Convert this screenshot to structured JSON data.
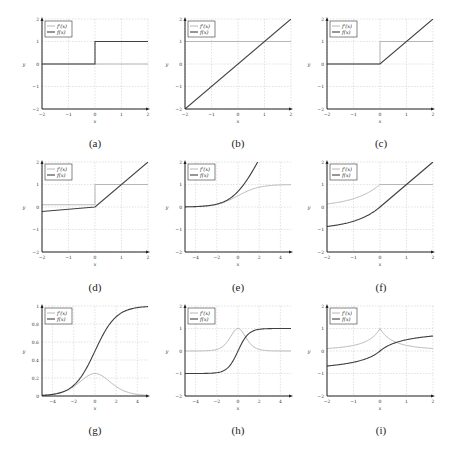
{
  "figure": {
    "colors": {
      "derivative": "#b0b0b0",
      "function": "#404040",
      "grid": "#cfcfcf",
      "axis": "#222222"
    },
    "legend": {
      "derivative_label": "f'(x)",
      "function_label": "f(x)"
    }
  },
  "chart_data": [
    {
      "id": "a",
      "caption": "(a)",
      "type": "line",
      "title": "Binary step",
      "xlabel": "x",
      "ylabel": "y",
      "xlim": [
        -2,
        2
      ],
      "ylim": [
        -2,
        2
      ],
      "xticks": [
        -2,
        -1,
        0,
        1,
        2
      ],
      "yticks": [
        -2,
        -1,
        0,
        1,
        2
      ],
      "grid": true,
      "legend_position": "upper left",
      "series": [
        {
          "name": "f'(x)",
          "x": [
            -2,
            2
          ],
          "y": [
            0,
            0
          ]
        },
        {
          "name": "f(x)",
          "x": [
            -2,
            0,
            0,
            2
          ],
          "y": [
            0,
            0,
            1,
            1
          ]
        }
      ]
    },
    {
      "id": "b",
      "caption": "(b)",
      "type": "line",
      "title": "Identity",
      "xlabel": "x",
      "ylabel": "y",
      "xlim": [
        -2,
        2
      ],
      "ylim": [
        -2,
        2
      ],
      "xticks": [
        -2,
        -1,
        0,
        1,
        2
      ],
      "yticks": [
        -2,
        -1,
        0,
        1,
        2
      ],
      "grid": true,
      "legend_position": "upper left",
      "series": [
        {
          "name": "f'(x)",
          "x": [
            -2,
            2
          ],
          "y": [
            1,
            1
          ]
        },
        {
          "name": "f(x)",
          "x": [
            -2,
            2
          ],
          "y": [
            -2,
            2
          ]
        }
      ]
    },
    {
      "id": "c",
      "caption": "(c)",
      "type": "line",
      "title": "ReLU",
      "xlabel": "x",
      "ylabel": "y",
      "xlim": [
        -2,
        2
      ],
      "ylim": [
        -2,
        2
      ],
      "xticks": [
        -2,
        -1,
        0,
        1,
        2
      ],
      "yticks": [
        -2,
        -1,
        0,
        1,
        2
      ],
      "grid": true,
      "legend_position": "upper left",
      "series": [
        {
          "name": "f'(x)",
          "x": [
            -2,
            0,
            0,
            2
          ],
          "y": [
            0,
            0,
            1,
            1
          ]
        },
        {
          "name": "f(x)",
          "x": [
            -2,
            0,
            2
          ],
          "y": [
            0,
            0,
            2
          ]
        }
      ]
    },
    {
      "id": "d",
      "caption": "(d)",
      "type": "line",
      "title": "Leaky ReLU",
      "xlabel": "x",
      "ylabel": "y",
      "xlim": [
        -2,
        2
      ],
      "ylim": [
        -2,
        2
      ],
      "xticks": [
        -2,
        -1,
        0,
        1,
        2
      ],
      "yticks": [
        -2,
        -1,
        0,
        1,
        2
      ],
      "grid": true,
      "legend_position": "upper left",
      "series": [
        {
          "name": "f'(x)",
          "x": [
            -2,
            0,
            0,
            2
          ],
          "y": [
            0.1,
            0.1,
            1,
            1
          ]
        },
        {
          "name": "f(x)",
          "x": [
            -2,
            0,
            2
          ],
          "y": [
            -0.2,
            0,
            2
          ]
        }
      ]
    },
    {
      "id": "e",
      "caption": "(e)",
      "type": "line",
      "title": "Softplus",
      "xlabel": "x",
      "ylabel": "y",
      "xlim": [
        -5,
        5
      ],
      "ylim": [
        -2,
        2
      ],
      "xticks": [
        -4,
        -2,
        0,
        2,
        4
      ],
      "yticks": [
        -2,
        -1,
        0,
        1,
        2
      ],
      "grid": true,
      "legend_position": "upper left",
      "series": [
        {
          "name": "f'(x)",
          "fn": "sigmoid",
          "x": [
            -5,
            -4,
            -3,
            -2,
            -1,
            0,
            1,
            2,
            3,
            4,
            5
          ],
          "y": [
            0.01,
            0.02,
            0.05,
            0.12,
            0.27,
            0.5,
            0.73,
            0.88,
            0.95,
            0.98,
            0.99
          ]
        },
        {
          "name": "f(x)",
          "fn": "softplus",
          "x": [
            -5,
            -4,
            -3,
            -2,
            -1,
            0,
            1,
            1.9
          ],
          "y": [
            0.01,
            0.02,
            0.05,
            0.13,
            0.31,
            0.69,
            1.31,
            2.0
          ]
        }
      ]
    },
    {
      "id": "f",
      "caption": "(f)",
      "type": "line",
      "title": "ELU",
      "xlabel": "x",
      "ylabel": "y",
      "xlim": [
        -2,
        2
      ],
      "ylim": [
        -2,
        2
      ],
      "xticks": [
        -2,
        -1,
        0,
        1,
        2
      ],
      "yticks": [
        -2,
        -1,
        0,
        1,
        2
      ],
      "grid": true,
      "legend_position": "upper left",
      "series": [
        {
          "name": "f'(x)",
          "fn": "elu_deriv",
          "x": [
            -2,
            -1.5,
            -1,
            -0.5,
            0,
            0,
            2
          ],
          "y": [
            0.14,
            0.22,
            0.37,
            0.61,
            1,
            1,
            1
          ]
        },
        {
          "name": "f(x)",
          "fn": "elu",
          "x": [
            -2,
            -1.5,
            -1,
            -0.5,
            0,
            1,
            2
          ],
          "y": [
            -0.86,
            -0.78,
            -0.63,
            -0.39,
            0,
            1,
            2
          ]
        }
      ]
    },
    {
      "id": "g",
      "caption": "(g)",
      "type": "line",
      "title": "Sigmoid",
      "xlabel": "x",
      "ylabel": "y",
      "xlim": [
        -5,
        5
      ],
      "ylim": [
        0,
        1
      ],
      "xticks": [
        -4,
        -2,
        0,
        2,
        4
      ],
      "yticks": [
        0,
        0.2,
        0.4,
        0.6,
        0.8,
        1
      ],
      "grid": true,
      "legend_position": "upper left",
      "series": [
        {
          "name": "f'(x)",
          "fn": "sigmoid_deriv",
          "x": [
            -5,
            -4,
            -3,
            -2,
            -1,
            0,
            1,
            2,
            3,
            4,
            5
          ],
          "y": [
            0.01,
            0.02,
            0.05,
            0.1,
            0.2,
            0.25,
            0.2,
            0.1,
            0.05,
            0.02,
            0.01
          ]
        },
        {
          "name": "f(x)",
          "fn": "sigmoid",
          "x": [
            -5,
            -4,
            -3,
            -2,
            -1,
            0,
            1,
            2,
            3,
            4,
            5
          ],
          "y": [
            0.01,
            0.02,
            0.05,
            0.12,
            0.27,
            0.5,
            0.73,
            0.88,
            0.95,
            0.98,
            0.99
          ]
        }
      ]
    },
    {
      "id": "h",
      "caption": "(h)",
      "type": "line",
      "title": "Tanh",
      "xlabel": "x",
      "ylabel": "y",
      "xlim": [
        -5,
        5
      ],
      "ylim": [
        -2,
        2
      ],
      "xticks": [
        -4,
        -2,
        0,
        2,
        4
      ],
      "yticks": [
        -2,
        -1,
        0,
        1,
        2
      ],
      "grid": true,
      "legend_position": "upper left",
      "series": [
        {
          "name": "f'(x)",
          "fn": "tanh_deriv",
          "x": [
            -5,
            -3,
            -2,
            -1,
            -0.5,
            0,
            0.5,
            1,
            2,
            3,
            5
          ],
          "y": [
            0,
            0.01,
            0.07,
            0.42,
            0.79,
            1,
            0.79,
            0.42,
            0.07,
            0.01,
            0
          ]
        },
        {
          "name": "f(x)",
          "fn": "tanh",
          "x": [
            -5,
            -3,
            -2,
            -1,
            -0.5,
            0,
            0.5,
            1,
            2,
            3,
            5
          ],
          "y": [
            -1,
            -0.99,
            -0.96,
            -0.76,
            -0.46,
            0,
            0.46,
            0.76,
            0.96,
            0.99,
            1
          ]
        }
      ]
    },
    {
      "id": "i",
      "caption": "(i)",
      "type": "line",
      "title": "Softsign",
      "xlabel": "x",
      "ylabel": "y",
      "xlim": [
        -2,
        2
      ],
      "ylim": [
        -2,
        2
      ],
      "xticks": [
        -2,
        -1,
        0,
        1,
        2
      ],
      "yticks": [
        -2,
        -1,
        0,
        1,
        2
      ],
      "grid": true,
      "legend_position": "upper left",
      "series": [
        {
          "name": "f'(x)",
          "fn": "softsign_deriv",
          "x": [
            -2,
            -1.5,
            -1,
            -0.5,
            0,
            0.5,
            1,
            1.5,
            2
          ],
          "y": [
            0.11,
            0.16,
            0.25,
            0.44,
            1,
            0.44,
            0.25,
            0.16,
            0.11
          ]
        },
        {
          "name": "f(x)",
          "fn": "softsign",
          "x": [
            -2,
            -1.5,
            -1,
            -0.5,
            0,
            0.5,
            1,
            1.5,
            2
          ],
          "y": [
            -0.67,
            -0.6,
            -0.5,
            -0.33,
            0,
            0.33,
            0.5,
            0.6,
            0.67
          ]
        }
      ]
    }
  ]
}
